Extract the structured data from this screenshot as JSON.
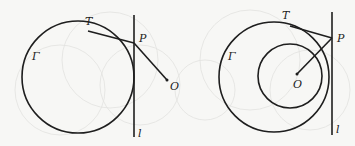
{
  "figures": [
    {
      "id": "left",
      "labels": {
        "circle": "Γ",
        "tangent_point": "T",
        "point_P": "P",
        "point_O": "O",
        "line": "l"
      }
    },
    {
      "id": "right",
      "labels": {
        "circle": "Γ",
        "tangent_point": "T",
        "point_P": "P",
        "point_O": "O",
        "line": "l"
      }
    }
  ],
  "colors": {
    "stroke": "#1e1e1e",
    "background": "#f7f7f5"
  }
}
